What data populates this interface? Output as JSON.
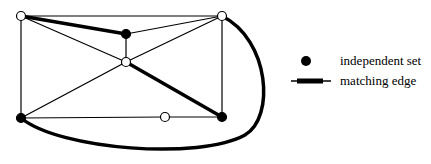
{
  "diagram": {
    "nodes": [
      {
        "id": "tl",
        "x": 21,
        "y": 16,
        "type": "open"
      },
      {
        "id": "tm",
        "x": 126,
        "y": 34,
        "type": "independent"
      },
      {
        "id": "c",
        "x": 126,
        "y": 62,
        "type": "open"
      },
      {
        "id": "tr",
        "x": 222,
        "y": 16,
        "type": "open"
      },
      {
        "id": "bl",
        "x": 21,
        "y": 118,
        "type": "independent"
      },
      {
        "id": "bm",
        "x": 165,
        "y": 117,
        "type": "open"
      },
      {
        "id": "br",
        "x": 222,
        "y": 117,
        "type": "independent"
      }
    ],
    "edges": [
      {
        "from": "tl",
        "to": "tr",
        "matching": false
      },
      {
        "from": "tl",
        "to": "tm",
        "matching": true
      },
      {
        "from": "tm",
        "to": "tr",
        "matching": false
      },
      {
        "from": "tm",
        "to": "c",
        "matching": false
      },
      {
        "from": "tl",
        "to": "c",
        "matching": false
      },
      {
        "from": "c",
        "to": "tr",
        "matching": false
      },
      {
        "from": "c",
        "to": "bl",
        "matching": false
      },
      {
        "from": "c",
        "to": "br",
        "matching": true
      },
      {
        "from": "tl",
        "to": "bl",
        "matching": false
      },
      {
        "from": "tr",
        "to": "br",
        "matching": false
      },
      {
        "from": "bl",
        "to": "bm",
        "matching": false
      },
      {
        "from": "bm",
        "to": "br",
        "matching": false
      },
      {
        "from": "bl",
        "to": "tr",
        "matching": true,
        "curved": true
      }
    ]
  },
  "legend": {
    "independent_set_label": "independent set",
    "matching_edge_label": "matching edge"
  },
  "colors": {
    "stroke": "#000000",
    "open_fill": "#ffffff",
    "filled": "#000000"
  }
}
